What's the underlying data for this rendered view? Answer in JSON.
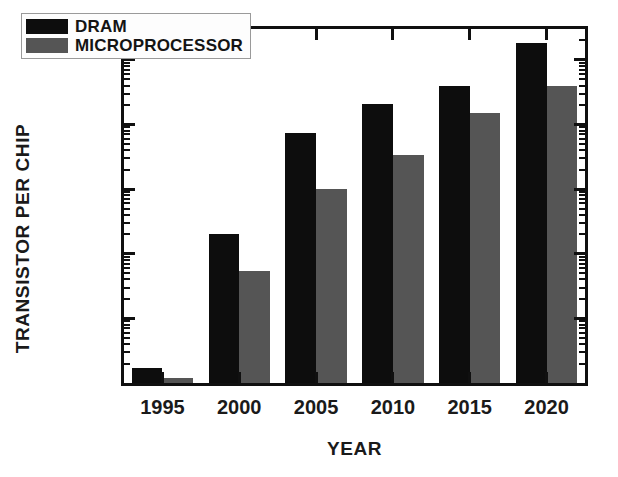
{
  "chart_data": {
    "type": "bar",
    "title": "",
    "xlabel": "YEAR",
    "ylabel": "TRANSISTOR PER CHIP",
    "yscale": "log",
    "ylim": [
      1000000,
      300000000000
    ],
    "grid": false,
    "legend_position": "top-left",
    "categories": [
      "1995",
      "2000",
      "2005",
      "2010",
      "2015",
      "2020"
    ],
    "ytick_labels": [
      "1E7",
      "1E8",
      "1E9",
      "1E10",
      "1E11"
    ],
    "ytick_values": [
      10000000,
      100000000,
      1000000000,
      10000000000,
      100000000000
    ],
    "series": [
      {
        "name": "DRAM",
        "color": "#0d0d0d",
        "values": [
          1700000,
          200000000,
          7500000000,
          21000000000,
          40000000000,
          180000000000
        ]
      },
      {
        "name": "MICROPROCESSOR",
        "color": "#555555",
        "values": [
          1200000,
          55000000,
          1000000000,
          3400000000,
          15000000000,
          40000000000
        ]
      }
    ]
  },
  "legend": {
    "items": [
      {
        "label": "DRAM",
        "swatch": "dram"
      },
      {
        "label": "MICROPROCESSOR",
        "swatch": "micro"
      }
    ]
  },
  "axes": {
    "y_title": "TRANSISTOR PER CHIP",
    "x_title": "YEAR"
  }
}
